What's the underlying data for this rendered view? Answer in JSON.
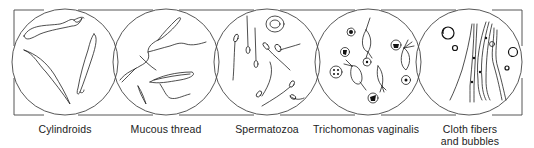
{
  "figure": {
    "panels": [
      {
        "id": "cylindroids",
        "caption": "Cylindroids",
        "center_x": 65
      },
      {
        "id": "mucous-thread",
        "caption": "Mucous thread",
        "center_x": 166
      },
      {
        "id": "spermatozoa",
        "caption": "Spermatozoa",
        "center_x": 267
      },
      {
        "id": "trichomonas-vaginalis",
        "caption": "Trichomonas vaginalis",
        "center_x": 368
      },
      {
        "id": "cloth-fibers-bubbles",
        "caption_line1": "Cloth fibers",
        "caption_line2": "and bubbles",
        "center_x": 469
      }
    ],
    "colors": {
      "ink": "#222222",
      "background": "#ffffff"
    }
  }
}
